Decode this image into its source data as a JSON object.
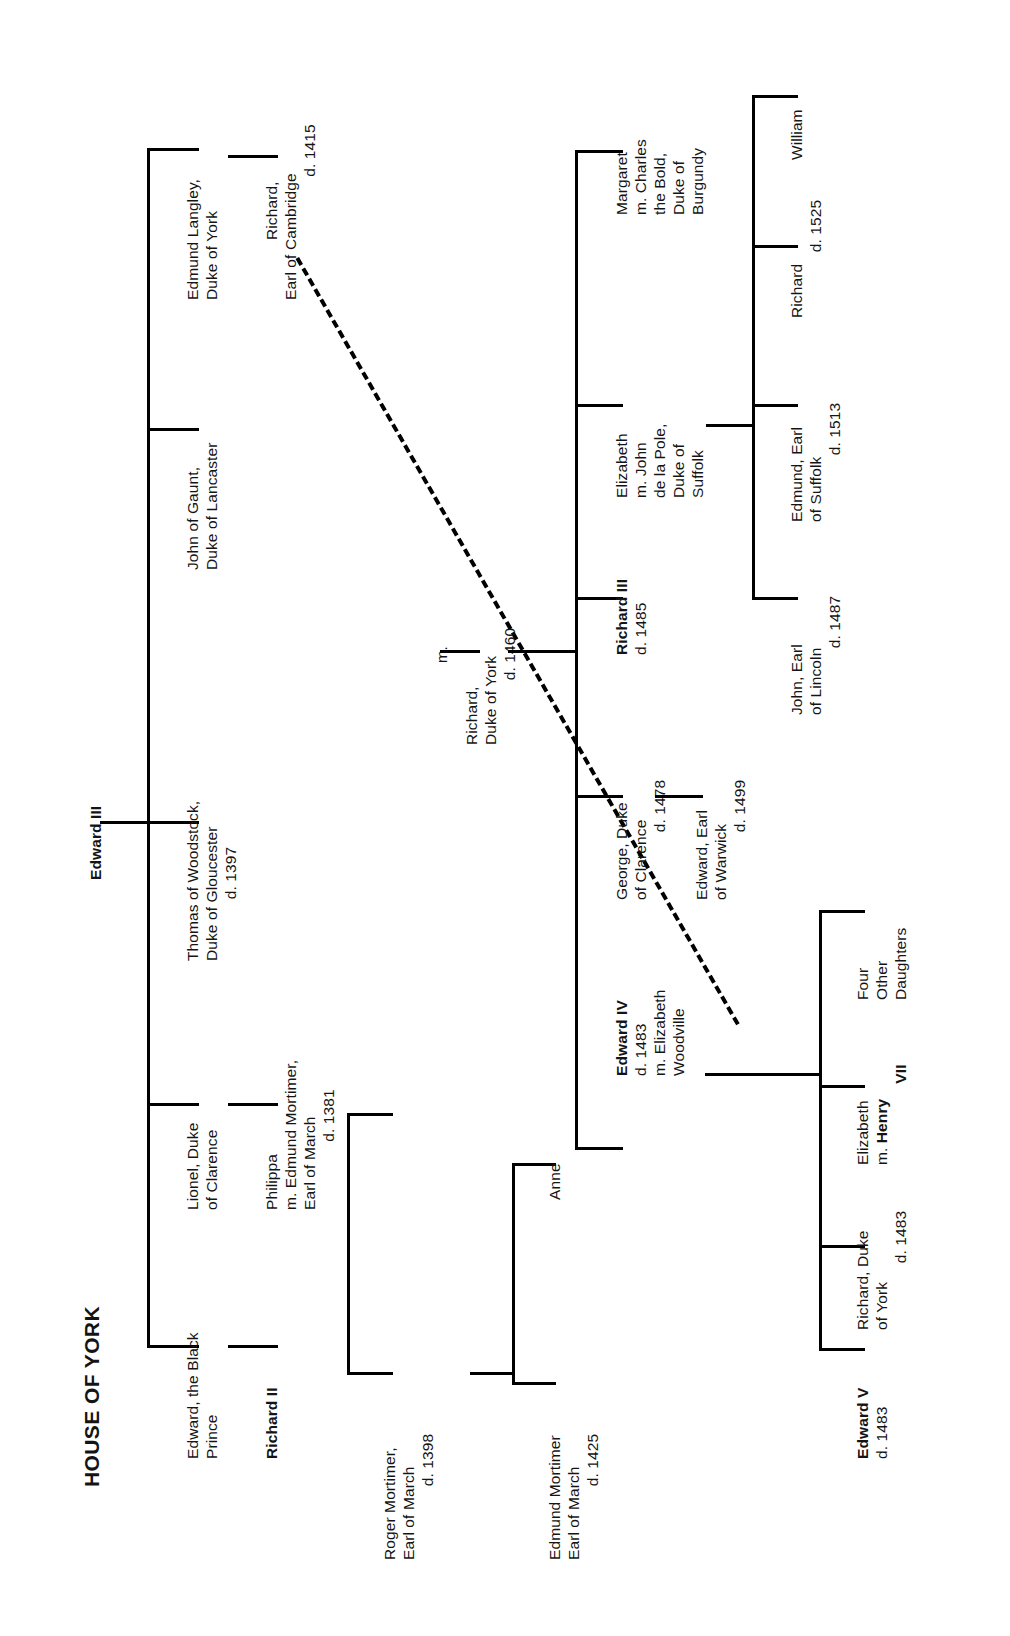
{
  "title": "HOUSE OF YORK",
  "root": {
    "name": "Edward III"
  },
  "generation1": [
    {
      "id": "black-prince",
      "lines": [
        "Edward, the Black",
        "Prince"
      ],
      "bold": false
    },
    {
      "id": "lionel-clarence",
      "lines": [
        "Lionel, Duke",
        "of Clarence"
      ],
      "bold": false
    },
    {
      "id": "thomas-woodstock",
      "lines": [
        "Thomas of Woodstock,",
        "Duke of Gloucester",
        "d. 1397"
      ],
      "bold": false
    },
    {
      "id": "john-of-gaunt",
      "lines": [
        "John of Gaunt,",
        "Duke of Lancaster"
      ],
      "bold": false
    },
    {
      "id": "edmund-langley",
      "lines": [
        "Edmund Langley,",
        "Duke of York"
      ],
      "bold": false
    }
  ],
  "generation2": [
    {
      "id": "richard-ii",
      "lines": [
        "Richard II"
      ],
      "bold": true
    },
    {
      "id": "philippa",
      "lines": [
        "Philippa",
        "m. Edmund Mortimer,",
        "Earl of March",
        "d. 1381"
      ],
      "bold": false
    },
    {
      "id": "richard-cambridge",
      "lines": [
        "Richard,",
        "Earl of Cambridge",
        "d. 1415"
      ],
      "bold": false
    }
  ],
  "mortimer_line": [
    {
      "id": "roger-mortimer",
      "lines": [
        "Roger Mortimer,",
        "Earl of March",
        "d. 1398"
      ],
      "bold": false
    },
    {
      "id": "edmund-mortimer",
      "lines": [
        "Edmund Mortimer",
        "Earl of March",
        "d. 1425"
      ],
      "bold": false
    },
    {
      "id": "anne",
      "lines": [
        "Anne"
      ],
      "bold": false
    }
  ],
  "marriage_marker": "m.",
  "richard_york": {
    "id": "richard-duke-york",
    "lines": [
      "Richard,",
      "Duke of York",
      "d. 1460"
    ],
    "bold": false
  },
  "generation4": [
    {
      "id": "edward-iv",
      "lines": [
        "Edward IV",
        "d. 1483",
        "m. Elizabeth",
        "Woodville"
      ],
      "bold_first_line": true
    },
    {
      "id": "george-clarence",
      "lines": [
        "George, Duke",
        "of Clarence",
        "d. 1478"
      ],
      "bold_first_line": false
    },
    {
      "id": "richard-iii",
      "lines": [
        "Richard III",
        "d. 1485"
      ],
      "bold_first_line": true
    },
    {
      "id": "elizabeth-suffolk",
      "lines": [
        "Elizabeth",
        "m. John",
        "de la Pole,",
        "Duke of",
        "Suffolk"
      ],
      "bold_first_line": false
    },
    {
      "id": "margaret-burgundy",
      "lines": [
        "Margaret",
        "m. Charles",
        "the Bold,",
        "Duke of",
        "Burgundy"
      ],
      "bold_first_line": false
    }
  ],
  "edward_warwick": {
    "id": "edward-warwick",
    "lines": [
      "Edward, Earl",
      "of Warwick",
      "d. 1499"
    ]
  },
  "edward_iv_children": [
    {
      "id": "edward-v",
      "lines": [
        "Edward V",
        "d. 1483"
      ],
      "bold_first_line": true
    },
    {
      "id": "richard-york-1483",
      "lines": [
        "Richard, Duke",
        "of York",
        "d. 1483"
      ],
      "bold_first_line": false
    },
    {
      "id": "elizabeth-henry-vii",
      "lines": [
        "Elizabeth",
        "m. Henry",
        "VII"
      ],
      "bold_first_line": false,
      "bold_tail": true
    },
    {
      "id": "four-other-daughters",
      "lines": [
        "Four",
        "Other",
        "Daughters"
      ],
      "bold_first_line": false
    }
  ],
  "suffolk_children": [
    {
      "id": "john-lincoln",
      "lines": [
        "John, Earl",
        "of Lincoln",
        "d. 1487"
      ]
    },
    {
      "id": "edmund-suffolk",
      "lines": [
        "Edmund, Earl",
        "of Suffolk",
        "d. 1513"
      ]
    },
    {
      "id": "richard-1525",
      "lines": [
        "Richard",
        "d. 1525"
      ]
    },
    {
      "id": "william",
      "lines": [
        "William"
      ]
    }
  ]
}
